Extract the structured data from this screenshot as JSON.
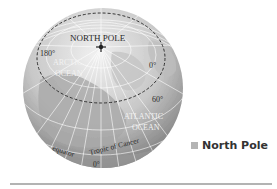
{
  "diagram": {
    "title": "North Pole",
    "labels": {
      "pole": "NORTH POLE",
      "meridian_180": "180°",
      "meridian_0": "0°",
      "lat_60": "60°",
      "arctic_line1": "ARCTIC",
      "arctic_line2": "OCEAN",
      "atlantic_line1": "ATLANTIC",
      "atlantic_line2": "OCEAN",
      "tropic": "Tropic of Cancer",
      "equator": "equator",
      "equator_deg": "0°"
    },
    "colors": {
      "globe_light": "#e6e6e6",
      "globe_dark": "#8c8c8c",
      "land": "#b9b9b9",
      "grid": "#ffffff",
      "arctic_circle": "#333333"
    }
  },
  "legend": {
    "items": [
      {
        "label": "North Pole",
        "color": "#b4b4b4"
      }
    ]
  }
}
